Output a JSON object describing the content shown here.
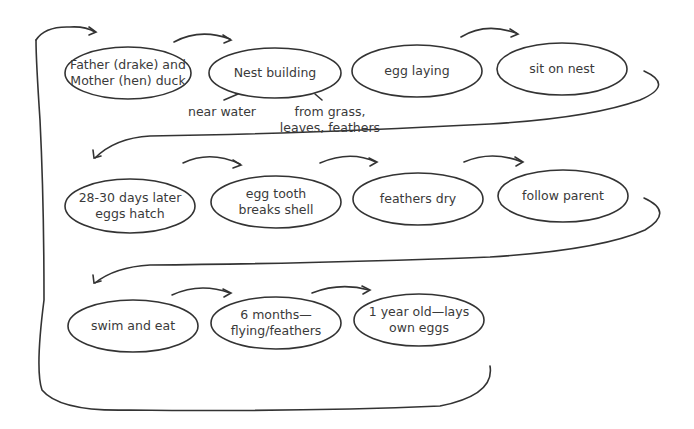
{
  "diagram": {
    "type": "life-cycle-flow",
    "rows": [
      {
        "nodes": [
          {
            "id": "n1",
            "label": "Father (drake) and\nMother (hen) duck"
          },
          {
            "id": "n2",
            "label": "Nest building"
          },
          {
            "id": "n3",
            "label": "egg laying"
          },
          {
            "id": "n4",
            "label": "sit on nest"
          }
        ]
      },
      {
        "nodes": [
          {
            "id": "n5",
            "label": "28-30 days later\neggs hatch"
          },
          {
            "id": "n6",
            "label": "egg tooth\nbreaks shell"
          },
          {
            "id": "n7",
            "label": "feathers dry"
          },
          {
            "id": "n8",
            "label": "follow parent"
          }
        ]
      },
      {
        "nodes": [
          {
            "id": "n9",
            "label": "swim and eat"
          },
          {
            "id": "n10",
            "label": "6 months—\nflying/feathers"
          },
          {
            "id": "n11",
            "label": "1 year old—lays\nown eggs"
          }
        ]
      }
    ],
    "notes": [
      {
        "attached_to": "n2",
        "label": "near water"
      },
      {
        "attached_to": "n2",
        "label": "from grass,\nleaves, feathers"
      }
    ],
    "edges": [
      [
        "n1",
        "n2"
      ],
      [
        "n2",
        "n3"
      ],
      [
        "n3",
        "n4"
      ],
      [
        "n4",
        "n5"
      ],
      [
        "n5",
        "n6"
      ],
      [
        "n6",
        "n7"
      ],
      [
        "n7",
        "n8"
      ],
      [
        "n8",
        "n9"
      ],
      [
        "n9",
        "n10"
      ],
      [
        "n10",
        "n11"
      ],
      [
        "n11",
        "n1"
      ]
    ]
  }
}
